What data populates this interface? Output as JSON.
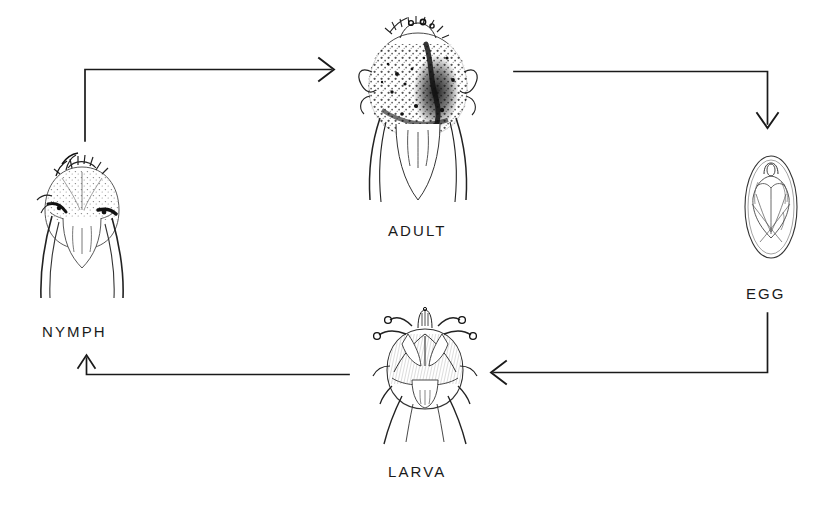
{
  "figure": {
    "type": "cycle-diagram",
    "background_color": "#ffffff",
    "ink_color": "#1a1a1a",
    "width": 831,
    "height": 520
  },
  "stages": [
    {
      "id": "adult",
      "label": "ADULT",
      "icon": "engorged-adult-tick-drawing",
      "label_x": 388,
      "label_y": 222,
      "art_x": 352,
      "art_y": 14,
      "art_w": 130,
      "art_h": 195
    },
    {
      "id": "egg",
      "label": "EGG",
      "icon": "tick-egg-drawing",
      "label_x": 746,
      "label_y": 285,
      "art_x": 740,
      "art_y": 152,
      "art_w": 62,
      "art_h": 108
    },
    {
      "id": "larva",
      "label": "LARVA",
      "icon": "six-legged-larva-tick-drawing",
      "label_x": 388,
      "label_y": 463,
      "art_x": 368,
      "art_y": 304,
      "art_w": 112,
      "art_h": 140
    },
    {
      "id": "nymph",
      "label": "NYMPH",
      "icon": "nymph-tick-drawing",
      "label_x": 42,
      "label_y": 323,
      "art_x": 32,
      "art_y": 152,
      "art_w": 100,
      "art_h": 148
    }
  ],
  "arrows": [
    {
      "id": "nymph-to-adult",
      "from": "nymph",
      "to": "adult",
      "direction": "right",
      "path": "M 85,142 L 85,69 L 333,69",
      "head_at": [
        333,
        69
      ]
    },
    {
      "id": "adult-to-egg",
      "from": "adult",
      "to": "egg",
      "direction": "down",
      "path": "M 513,71 L 768,71 L 768,126",
      "head_at": [
        768,
        126
      ]
    },
    {
      "id": "egg-to-larva",
      "from": "egg",
      "to": "larva",
      "direction": "left",
      "path": "M 768,312 L 768,372 L 492,372",
      "head_at": [
        492,
        372
      ]
    },
    {
      "id": "larva-to-nymph",
      "from": "larva",
      "to": "nymph",
      "direction": "up",
      "path": "M 348,374 L 86,374 L 86,356",
      "head_at": [
        86,
        356
      ]
    }
  ]
}
